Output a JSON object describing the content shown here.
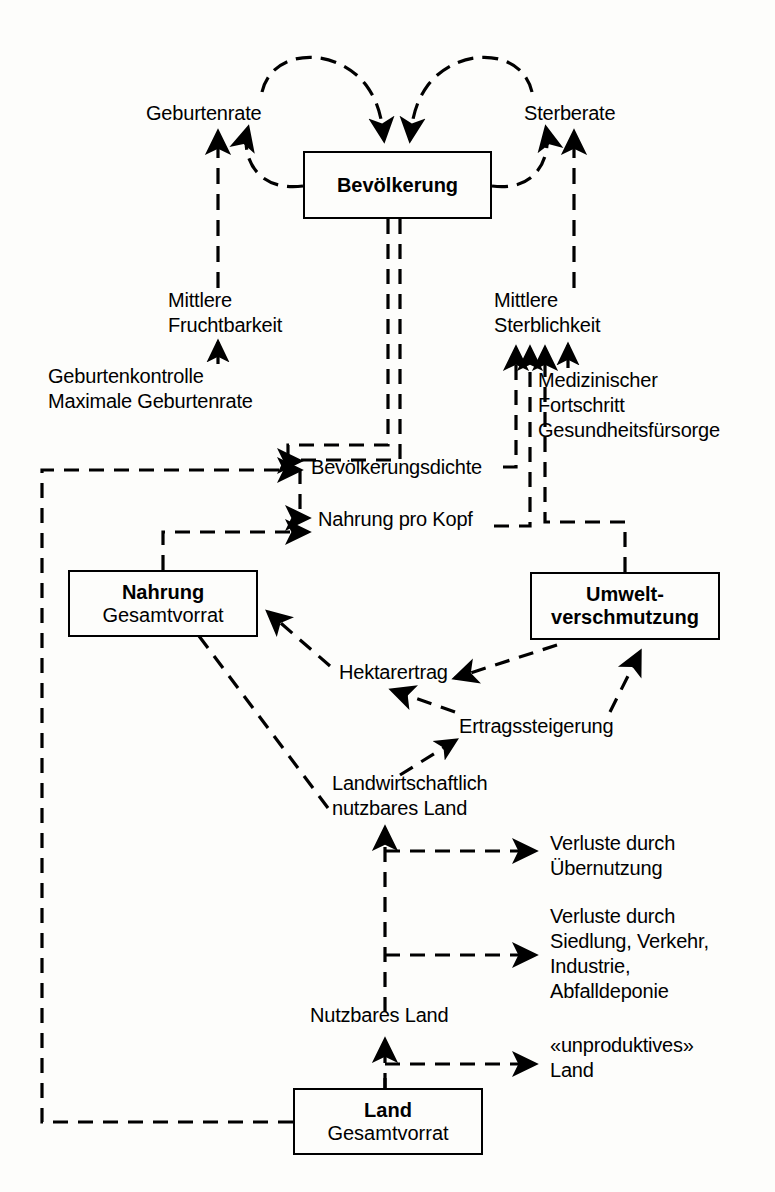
{
  "diagram": {
    "language": "de",
    "style": {
      "line_color": "#000000",
      "background": "#fdfdfb",
      "stroke_style": "dashed"
    },
    "stocks": [
      {
        "id": "bevoelkerung",
        "line1": "Bevölkerung",
        "line2": ""
      },
      {
        "id": "nahrung",
        "line1": "Nahrung",
        "line2": "Gesamtvorrat"
      },
      {
        "id": "umwelt",
        "line1": "Umwelt-",
        "line2": "verschmutzung"
      },
      {
        "id": "land",
        "line1": "Land",
        "line2": "Gesamtvorrat"
      }
    ],
    "labels": {
      "geburtenrate": "Geburtenrate",
      "sterberate": "Sterberate",
      "mittlere_fruchtbarkeit_l1": "Mittlere",
      "mittlere_fruchtbarkeit_l2": "Fruchtbarkeit",
      "geburtenkontrolle": "Geburtenkontrolle",
      "maximale_geburtenrate": "Maximale Geburtenrate",
      "mittlere_sterblichkeit_l1": "Mittlere",
      "mittlere_sterblichkeit_l2": "Sterblichkeit",
      "medizinischer_fortschritt_l1": "Medizinischer",
      "medizinischer_fortschritt_l2": "Fortschritt",
      "gesundheitsfuersorge": "Gesundheitsfürsorge",
      "bevoelkerungsdichte": "Bevölkerungsdichte",
      "nahrung_pro_kopf": "Nahrung pro Kopf",
      "hektarertrag": "Hektarertrag",
      "ertragssteigerung": "Ertragssteigerung",
      "landwirtschaftlich_l1": "Landwirtschaftlich",
      "landwirtschaftlich_l2": "nutzbares Land",
      "verluste_uebernutzung_l1": "Verluste durch",
      "verluste_uebernutzung_l2": "Übernutzung",
      "verluste_siedlung_l1": "Verluste durch",
      "verluste_siedlung_l2": "Siedlung, Verkehr,",
      "verluste_siedlung_l3": "Industrie,",
      "verluste_siedlung_l4": "Abfalldeponie",
      "nutzbares_land": "Nutzbares Land",
      "unproduktives_l1": "«unproduktives»",
      "unproduktives_l2": "Land"
    }
  }
}
